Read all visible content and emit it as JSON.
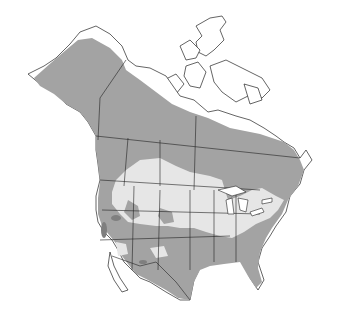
{
  "map": {
    "type": "species-range-map",
    "region": "North America",
    "legend_colors": {
      "year_round": "#a3a3a3",
      "breeding": "#e6e6e6",
      "winter": "#7f7f7f",
      "border": "#222222",
      "water": "#ffffff"
    }
  }
}
